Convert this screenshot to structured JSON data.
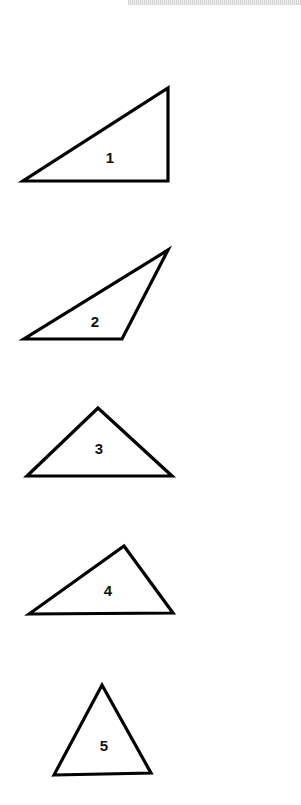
{
  "page": {
    "width": 301,
    "height": 805,
    "background": "#ffffff",
    "top_bar_color": "#e0e0e0"
  },
  "stroke_color": "#000000",
  "triangles": [
    {
      "label": "1",
      "points": [
        [
          23,
          181
        ],
        [
          168,
          181
        ],
        [
          168,
          88
        ]
      ],
      "label_pos": [
        110,
        157
      ]
    },
    {
      "label": "2",
      "points": [
        [
          24,
          339
        ],
        [
          122,
          339
        ],
        [
          168,
          250
        ]
      ],
      "label_pos": [
        95,
        321
      ]
    },
    {
      "label": "3",
      "points": [
        [
          27,
          476
        ],
        [
          172,
          476
        ],
        [
          98,
          408
        ]
      ],
      "label_pos": [
        99,
        448
      ]
    },
    {
      "label": "4",
      "points": [
        [
          29,
          614
        ],
        [
          173,
          613
        ],
        [
          124,
          546
        ]
      ],
      "label_pos": [
        108,
        590
      ]
    },
    {
      "label": "5",
      "points": [
        [
          54,
          775
        ],
        [
          151,
          773
        ],
        [
          102,
          685
        ]
      ],
      "label_pos": [
        104,
        745
      ]
    }
  ]
}
